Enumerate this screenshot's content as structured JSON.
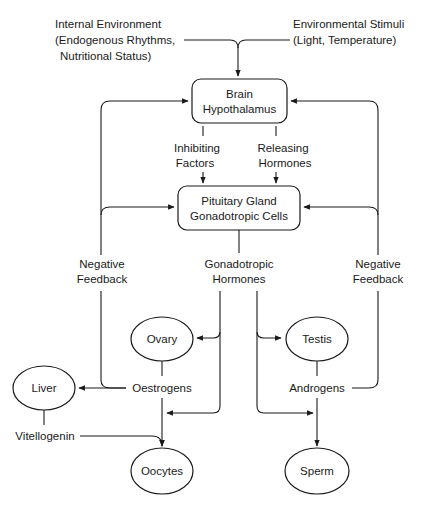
{
  "diagram": {
    "inputs": {
      "internal": [
        "Internal Environment",
        "(Endogenous Rhythms,",
        "Nutritional Status)"
      ],
      "external": [
        "Environmental Stimuli",
        "(Light, Temperature)"
      ]
    },
    "nodes": {
      "brain": [
        "Brain",
        "Hypothalamus"
      ],
      "pituitary": [
        "Pituitary Gland",
        "Gonadotropic Cells"
      ],
      "ovary": "Ovary",
      "testis": "Testis",
      "liver": "Liver",
      "oocytes": "Oocytes",
      "sperm": "Sperm"
    },
    "edges": {
      "inhibiting": [
        "Inhibiting",
        "Factors"
      ],
      "releasing": [
        "Releasing",
        "Hormones"
      ],
      "gonadotropic": [
        "Gonadotropic",
        "Hormones"
      ],
      "neg_feedback_left": [
        "Negative",
        "Feedback"
      ],
      "neg_feedback_right": [
        "Negative",
        "Feedback"
      ],
      "oestrogens": "Oestrogens",
      "androgens": "Androgens",
      "vitellogenin": "Vitellogenin"
    },
    "colors": {
      "ink": "#1a1a1a",
      "background": "#ffffff"
    }
  }
}
